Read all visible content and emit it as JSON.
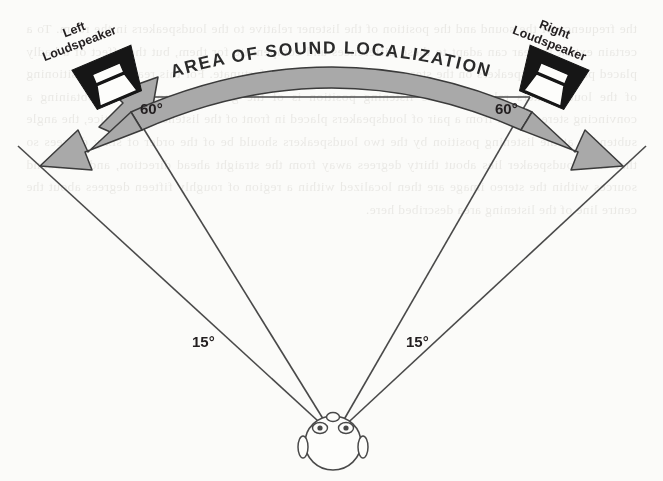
{
  "figure": {
    "type": "diagram",
    "background_color": "#fbfbf9",
    "band_color": "#a9a9a9",
    "band_outline_color": "#3a3a3a",
    "line_color": "#4a4a4a",
    "speaker_color": "#1a1a1a",
    "text_color": "#231f20"
  },
  "arc": {
    "banner_text": "AREA OF SOUND LOCALIZATION"
  },
  "speakers": {
    "left": {
      "line1": "Left",
      "line2": "Loudspeaker"
    },
    "right": {
      "line1": "Right",
      "line2": "Loudspeaker"
    }
  },
  "angles": {
    "outer_left": "60°",
    "outer_right": "60°",
    "inner_left": "15°",
    "inner_right": "15°"
  },
  "listener": {
    "name": "head-top-view"
  },
  "ghost_text": "the frequency of the sound and the position of the listener relative to the loudspeakers in the room. To a certain extent the ear can adapt to these differences and compensate for them, but the effect of a badly placed pair of loudspeakers on the stereo image can be most unfortunate. For this reason the positioning of the loudspeakers relative to the listening position is of the greatest importance in obtaining a convincing stereo effect from a pair of loudspeakers placed in front of the listener. In practice, the angle subtended at the listening position by the two loudspeakers should be of the order of sixty degrees so that each loudspeaker lies about thirty degrees away from the straight ahead direction, and the sound sources within the stereo image are then localized within a region of roughly fifteen degrees about the centre line of the listening area described here."
}
